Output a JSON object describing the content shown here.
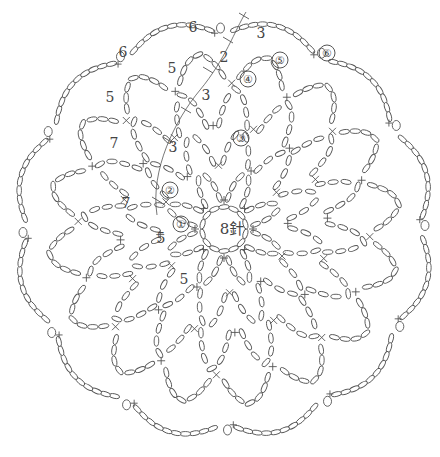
{
  "diagram": {
    "type": "crochet-chart",
    "center_label": "8針",
    "round_markers": [
      {
        "label": "①",
        "x": 181,
        "y": 224
      },
      {
        "label": "②",
        "x": 170,
        "y": 190
      },
      {
        "label": "③",
        "x": 241,
        "y": 138
      },
      {
        "label": "④",
        "x": 248,
        "y": 79
      },
      {
        "label": "⑤",
        "x": 280,
        "y": 60
      },
      {
        "label": "⑥",
        "x": 327,
        "y": 53
      }
    ],
    "chain_counts": [
      {
        "label": "6",
        "x": 193,
        "y": 27
      },
      {
        "label": "3",
        "x": 261,
        "y": 33
      },
      {
        "label": "6",
        "x": 123,
        "y": 52
      },
      {
        "label": "2",
        "x": 224,
        "y": 57
      },
      {
        "label": "5",
        "x": 172,
        "y": 68
      },
      {
        "label": "5",
        "x": 110,
        "y": 97
      },
      {
        "label": "3",
        "x": 206,
        "y": 95
      },
      {
        "label": "7",
        "x": 114,
        "y": 143
      },
      {
        "label": "3",
        "x": 173,
        "y": 147
      },
      {
        "label": "7",
        "x": 126,
        "y": 203
      },
      {
        "label": "5",
        "x": 161,
        "y": 238
      },
      {
        "label": "5",
        "x": 184,
        "y": 279
      }
    ]
  }
}
